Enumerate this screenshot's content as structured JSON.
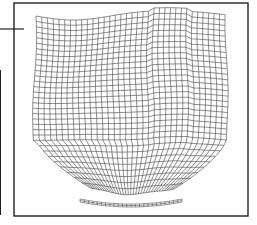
{
  "figure": {
    "type": "finite-element-mesh",
    "frame": {
      "x": 14,
      "y": 3,
      "w": 234,
      "h": 213
    },
    "colors": {
      "line": "#333333",
      "frame": "#222222",
      "background": "#ffffff"
    },
    "leader_line": {
      "x1": 0,
      "y1": 29,
      "x2": 24,
      "y2": 29
    },
    "left_bar": {
      "x": 0,
      "y1": 70,
      "y2": 215
    },
    "main_mesh": {
      "cols": 34,
      "rows": 32
    },
    "strip_mesh": {
      "cols": 24,
      "label": "thin-curved-strip"
    }
  }
}
